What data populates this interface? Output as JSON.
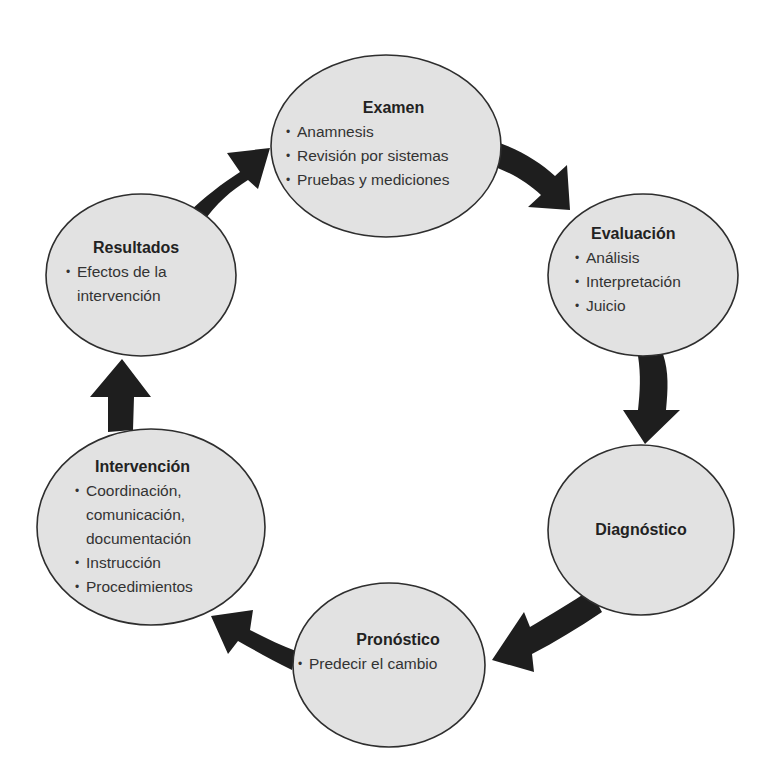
{
  "diagram": {
    "type": "cycle",
    "colors": {
      "node_fill": "#e2e2e2",
      "node_stroke": "#2e2e2e",
      "arrow": "#1e1e1e",
      "background": "#ffffff"
    },
    "nodes": [
      {
        "id": "examen",
        "title": "Examen",
        "items": [
          "Anamnesis",
          "Revisión por sistemas",
          "Pruebas y mediciones"
        ]
      },
      {
        "id": "evaluacion",
        "title": "Evaluación",
        "items": [
          "Análisis",
          "Interpretación",
          "Juicio"
        ]
      },
      {
        "id": "diagnostico",
        "title": "Diagnóstico",
        "items": []
      },
      {
        "id": "pronostico",
        "title": "Pronóstico",
        "items": [
          "Predecir el cambio"
        ]
      },
      {
        "id": "intervencion",
        "title": "Intervención",
        "items": [
          "Coordinación,",
          "comunicación,",
          "documentación",
          "Instrucción",
          "Procedimientos"
        ]
      },
      {
        "id": "resultados",
        "title": "Resultados",
        "items": [
          "Efectos de la",
          "intervención"
        ]
      }
    ],
    "edges": [
      {
        "from": "Examen",
        "to": "Evaluación"
      },
      {
        "from": "Evaluación",
        "to": "Diagnóstico"
      },
      {
        "from": "Diagnóstico",
        "to": "Pronóstico"
      },
      {
        "from": "Pronóstico",
        "to": "Intervención"
      },
      {
        "from": "Intervención",
        "to": "Resultados"
      },
      {
        "from": "Resultados",
        "to": "Examen"
      }
    ]
  }
}
